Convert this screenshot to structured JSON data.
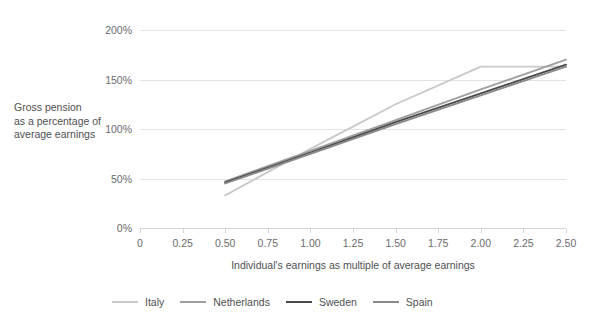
{
  "chart_data": {
    "type": "line",
    "title": "",
    "xlabel": "Individual's earnings as multiple of average earnings",
    "ylabel": "Gross pension as a percentage of average earnings",
    "xlim": [
      0,
      2.5
    ],
    "ylim": [
      0,
      200
    ],
    "grid": true,
    "legend_position": "bottom",
    "x_ticks": [
      "0",
      "0.25",
      "0.50",
      "0.75",
      "1.00",
      "1.25",
      "1.50",
      "1.75",
      "2.00",
      "2.25",
      "2.50"
    ],
    "x_tick_values": [
      0,
      0.25,
      0.5,
      0.75,
      1.0,
      1.25,
      1.5,
      1.75,
      2.0,
      2.25,
      2.5
    ],
    "y_ticks": [
      "0%",
      "50%",
      "100%",
      "150%",
      "200%"
    ],
    "y_tick_values": [
      0,
      50,
      100,
      150,
      200
    ],
    "series": [
      {
        "name": "Italy",
        "color": "#c9c9c9",
        "x": [
          0.5,
          1.0,
          1.5,
          2.0,
          2.5
        ],
        "values": [
          33,
          80,
          125,
          163,
          163
        ]
      },
      {
        "name": "Netherlands",
        "color": "#a0a0a0",
        "x": [
          0.5,
          1.0,
          1.5,
          2.0,
          2.5
        ],
        "values": [
          47,
          78,
          109,
          140,
          170
        ]
      },
      {
        "name": "Sweden",
        "color": "#4a4a4a",
        "x": [
          0.5,
          1.0,
          1.5,
          2.0,
          2.5
        ],
        "values": [
          46,
          76,
          107,
          136,
          165
        ]
      },
      {
        "name": "Spain",
        "color": "#8a8a8a",
        "x": [
          0.5,
          1.0,
          1.5,
          2.0,
          2.5
        ],
        "values": [
          45,
          75,
          105,
          134,
          163
        ]
      }
    ]
  },
  "legend": {
    "items": [
      {
        "label": "Italy",
        "color": "#c9c9c9"
      },
      {
        "label": "Netherlands",
        "color": "#a0a0a0"
      },
      {
        "label": "Sweden",
        "color": "#4a4a4a"
      },
      {
        "label": "Spain",
        "color": "#8a8a8a"
      }
    ]
  },
  "axis_titles": {
    "y_line_1": "Gross pension",
    "y_line_2": "as a percentage of",
    "y_line_3": "average earnings",
    "x": "Individual's earnings as multiple of average earnings"
  }
}
